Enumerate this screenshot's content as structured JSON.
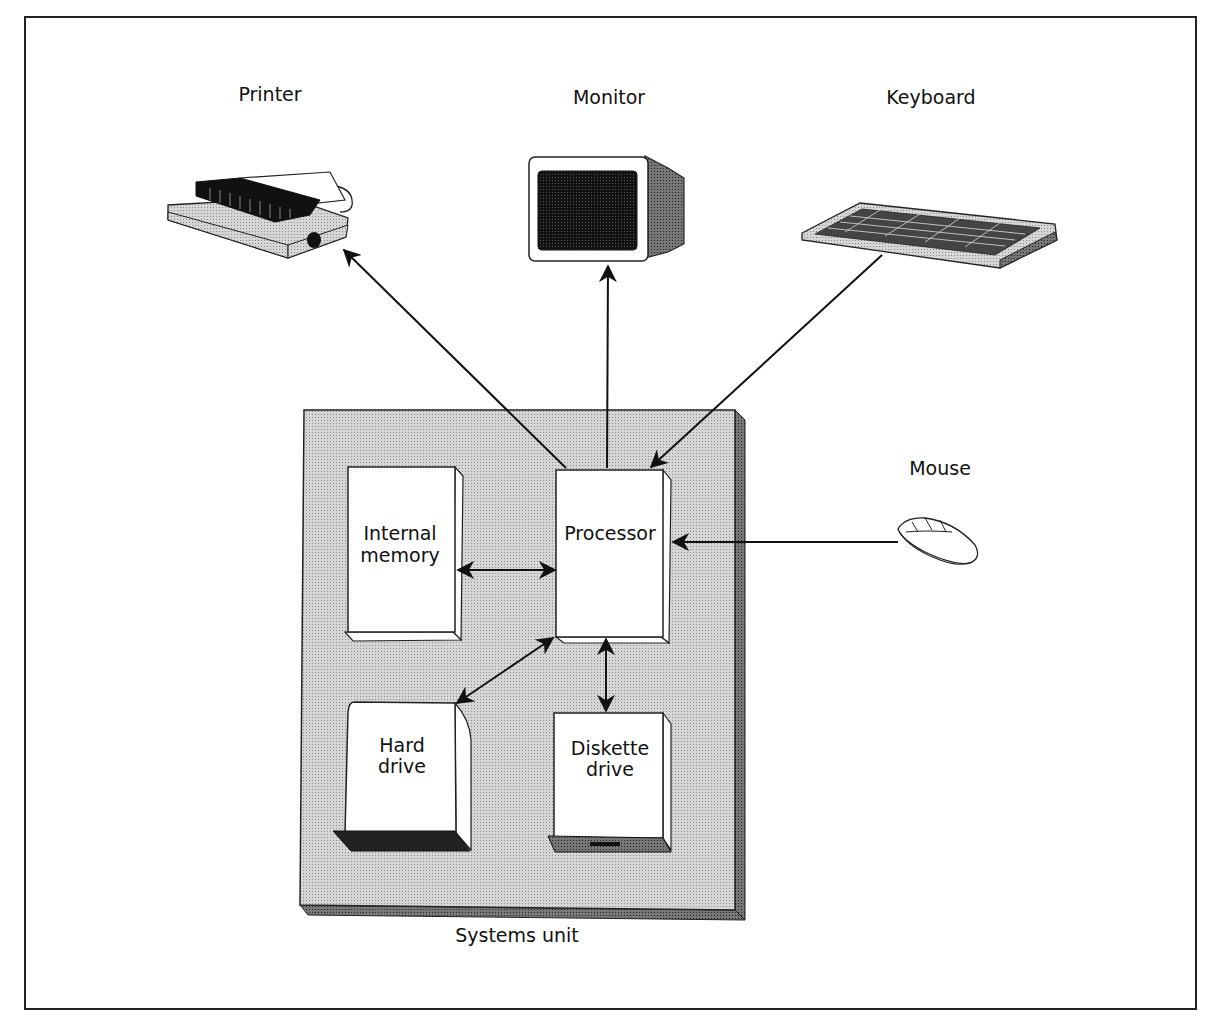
{
  "diagram": {
    "devices": {
      "printer": "Printer",
      "monitor": "Monitor",
      "keyboard": "Keyboard",
      "mouse": "Mouse"
    },
    "systems_unit": {
      "label": "Systems unit",
      "components": {
        "internal_memory": [
          "Internal",
          "memory"
        ],
        "processor": "Processor",
        "hard_drive": [
          "Hard",
          "drive"
        ],
        "diskette_drive": [
          "Diskette",
          "drive"
        ]
      }
    },
    "connections": [
      {
        "from": "Processor",
        "to": "Printer",
        "direction": "one-way"
      },
      {
        "from": "Processor",
        "to": "Monitor",
        "direction": "one-way"
      },
      {
        "from": "Keyboard",
        "to": "Processor",
        "direction": "one-way"
      },
      {
        "from": "Mouse",
        "to": "Processor",
        "direction": "one-way"
      },
      {
        "from": "Processor",
        "to": "Internal memory",
        "direction": "two-way"
      },
      {
        "from": "Processor",
        "to": "Hard drive",
        "direction": "two-way"
      },
      {
        "from": "Processor",
        "to": "Diskette drive",
        "direction": "two-way"
      }
    ]
  }
}
